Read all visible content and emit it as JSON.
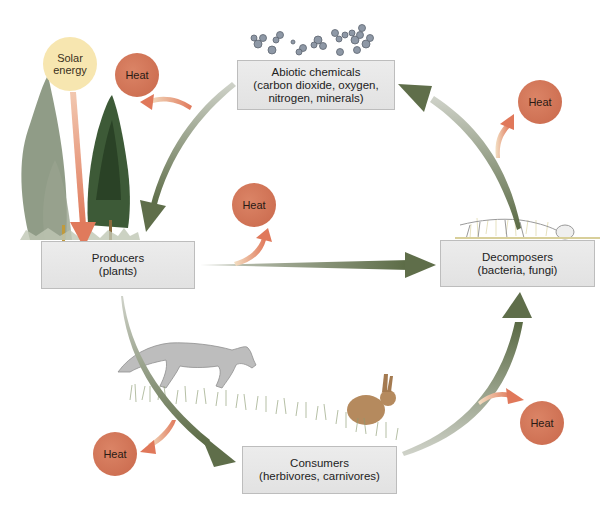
{
  "diagram": {
    "type": "ecosystem-cycle",
    "nodes": {
      "abiotic": {
        "title": "Abiotic chemicals",
        "line2": "(carbon dioxide, oxygen,",
        "line3": "nitrogen, minerals)"
      },
      "producers": {
        "title": "Producers",
        "line2": "(plants)"
      },
      "consumers": {
        "title": "Consumers",
        "line2": "(herbivores, carnivores)"
      },
      "decomposers": {
        "title": "Decomposers",
        "line2": "(bacteria, fungi)"
      }
    },
    "energy_source": {
      "line1": "Solar",
      "line2": "energy"
    },
    "heat_label": "Heat",
    "heat_nodes": [
      {
        "id": "heat-producers",
        "label": "Heat"
      },
      {
        "id": "heat-middle",
        "label": "Heat"
      },
      {
        "id": "heat-decomposers",
        "label": "Heat"
      },
      {
        "id": "heat-consumers",
        "label": "Heat"
      },
      {
        "id": "heat-consumers-right",
        "label": "Heat"
      }
    ],
    "flows": [
      {
        "from": "abiotic",
        "to": "producers",
        "kind": "matter"
      },
      {
        "from": "producers",
        "to": "decomposers",
        "kind": "matter"
      },
      {
        "from": "producers",
        "to": "consumers",
        "kind": "matter"
      },
      {
        "from": "consumers",
        "to": "decomposers",
        "kind": "matter"
      },
      {
        "from": "decomposers",
        "to": "abiotic",
        "kind": "matter"
      },
      {
        "from": "solar",
        "to": "producers",
        "kind": "energy"
      }
    ],
    "colors": {
      "matter_arrow": "#5f6e4a",
      "energy_arrow": "#e08a6c",
      "heat_circle": "#cf7356",
      "solar_circle": "#f7e6b0",
      "box_fill": "#e6e6e6"
    }
  }
}
